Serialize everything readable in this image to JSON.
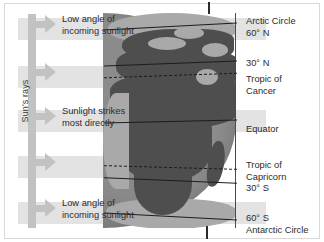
{
  "figure": {
    "type": "diagram"
  },
  "rays": {
    "axis_label": "Sun's rays",
    "bands": [
      {
        "id": "band-top",
        "label_line1": "Low angle of",
        "label_line2": "incoming sunlight",
        "y": 18,
        "width": "wide"
      },
      {
        "id": "band-upper-mid",
        "label_line1": "",
        "label_line2": "",
        "y": 66,
        "width": "short"
      },
      {
        "id": "band-middle",
        "label_line1": "Sunlight strikes",
        "label_line2": "most directly",
        "y": 110,
        "width": "wide"
      },
      {
        "id": "band-lower-mid",
        "label_line1": "",
        "label_line2": "",
        "y": 156,
        "width": "short"
      },
      {
        "id": "band-bottom",
        "label_line1": "Low angle of",
        "label_line2": "incoming sunlight",
        "y": 202,
        "width": "wide"
      }
    ],
    "callouts": [
      {
        "line1": "Low angle of",
        "line2": "incoming sunlight"
      },
      {
        "line1": "Sunlight strikes",
        "line2": "most directly"
      },
      {
        "line1": "Low angle of",
        "line2": "incoming sunlight"
      }
    ]
  },
  "latitudes": [
    {
      "id": "arctic-circle",
      "label_line1": "Arctic Circle",
      "label_line2": "60° N",
      "style": "solid",
      "y": 26
    },
    {
      "id": "thirty-north",
      "label_line1": "30° N",
      "label_line2": "",
      "style": "solid",
      "y": 63
    },
    {
      "id": "tropic-of-cancer",
      "label_line1": "Tropic of",
      "label_line2": "Cancer",
      "style": "dashed",
      "y": 75
    },
    {
      "id": "equator",
      "label_line1": "Equator",
      "label_line2": "",
      "style": "solid",
      "y": 121
    },
    {
      "id": "tropic-of-capricorn",
      "label_line1": "Tropic of",
      "label_line2": "Capricorn",
      "style": "dashed",
      "y": 167
    },
    {
      "id": "thirty-south",
      "label_line1": "30° S",
      "label_line2": "",
      "style": "solid",
      "y": 180
    },
    {
      "id": "antarctic-circle",
      "label_line1": "60° S",
      "label_line2": "Antarctic Circle",
      "style": "solid",
      "y": 216
    }
  ],
  "colors": {
    "band": "#e3e3e3",
    "arrow": "#c2c2c2",
    "globe_ocean": "#8a8a8a",
    "globe_land": "#4e4e4e",
    "line": "#1d1d1d",
    "text": "#2b2b2b",
    "background": "#ffffff"
  }
}
